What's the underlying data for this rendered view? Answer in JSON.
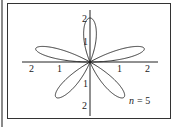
{
  "chart_data": {
    "type": "line",
    "subtype": "polar-rose",
    "title": "",
    "annotation": "n = 5",
    "equation_implied": "r = 2 sin(nθ)",
    "n": 5,
    "amplitude": 2,
    "petal_count": 5,
    "petal_angles_deg": [
      18,
      90,
      162,
      234,
      306
    ],
    "xlim": [
      -2.3,
      2.3
    ],
    "ylim": [
      -2.3,
      2.3
    ],
    "x_ticks": [
      "2",
      "1",
      "1",
      "2"
    ],
    "x_tick_values": [
      -2,
      -1,
      1,
      2
    ],
    "y_ticks": [
      "2",
      "1",
      "1",
      "2"
    ],
    "y_tick_values": [
      2,
      1,
      -1,
      -2
    ],
    "grid": false,
    "legend": null
  },
  "labels": {
    "annotation_n": "n",
    "annotation_eq": "= 5",
    "xtick_neg2": "2",
    "xtick_neg1": "1",
    "xtick_pos1": "1",
    "xtick_pos2": "2",
    "ytick_pos2": "2",
    "ytick_pos1": "1",
    "ytick_neg1": "1",
    "ytick_neg2": "2"
  }
}
